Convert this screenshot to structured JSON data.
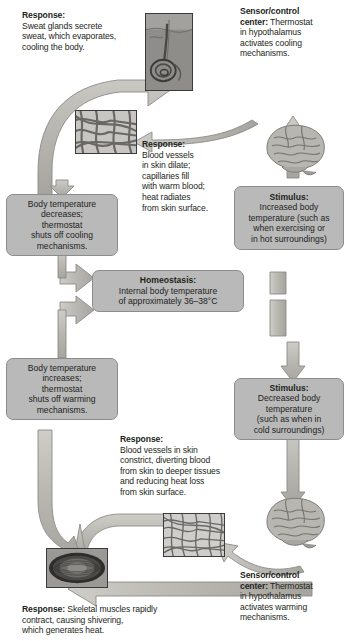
{
  "diagram": {
    "colors": {
      "box_fill": "#b9b9b9",
      "box_stroke": "#8d8d8d",
      "arrow_fill": "#b5b3ad",
      "arrow_stroke": "#8d8b86",
      "text": "#231f20"
    }
  },
  "center": {
    "title": "Homeostasis:",
    "line1": "Internal body temperature",
    "line2": "of approximately 36–38°C"
  },
  "boxes": [
    {
      "id": "body-temp-decreases",
      "title": "",
      "lines": [
        "Body temperature",
        "decreases;",
        "thermostat",
        "shuts off cooling",
        "mechanisms."
      ]
    },
    {
      "id": "stimulus-increased",
      "title": "Stimulus:",
      "lines": [
        "Increased body",
        "temperature (such as",
        "when exercising or",
        "in hot surroundings)"
      ]
    },
    {
      "id": "body-temp-increases",
      "title": "",
      "lines": [
        "Body temperature",
        "increases;",
        "thermostat",
        "shuts off warming",
        "mechanisms."
      ]
    },
    {
      "id": "stimulus-decreased",
      "title": "Stimulus:",
      "lines": [
        "Decreased body",
        "temperature",
        "(such as when in",
        "cold surroundings)"
      ]
    }
  ],
  "callouts": {
    "sweat_response": {
      "lead": "Response:",
      "lines": [
        "Sweat glands secrete",
        "sweat, which evaporates,",
        "cooling the body."
      ]
    },
    "cooling_sensor": {
      "lead": "Sensor/control",
      "lead2": "center:",
      "rest": " Thermostat",
      "lines": [
        "in hypothalamus",
        "activates cooling",
        "mechanisms."
      ]
    },
    "vasodilation_response": {
      "lead": "Response:",
      "lines": [
        "Blood vessels",
        "in skin dilate;",
        "capillaries fill",
        "with warm blood;",
        "heat radiates",
        "from skin surface."
      ]
    },
    "vasoconstriction_response": {
      "lead": "Response:",
      "lines": [
        "Blood vessels in skin",
        "constrict, diverting blood",
        "from skin to deeper tissues",
        "and reducing heat loss",
        "from skin surface."
      ]
    },
    "warming_sensor": {
      "lead": "Sensor/control",
      "lead2": "center:",
      "rest": " Thermostat",
      "lines": [
        "in hypothalamus",
        "activates warming",
        "mechanisms."
      ]
    },
    "shivering_response": {
      "lead": "Response:",
      "rest": " Skeletal muscles rapidly",
      "lines": [
        "contract, causing shivering,",
        "which generates heat."
      ]
    }
  },
  "images": {
    "sweat_gland": "sweat-gland-micrograph",
    "skin_dilated": "dilated-capillaries-micrograph",
    "brain_cooling": "brain-hypothalamus-illustration",
    "brain_warming": "brain-hypothalamus-illustration",
    "skin_constricted": "constricted-capillaries-micrograph",
    "muscle_fiber": "skeletal-muscle-micrograph"
  }
}
